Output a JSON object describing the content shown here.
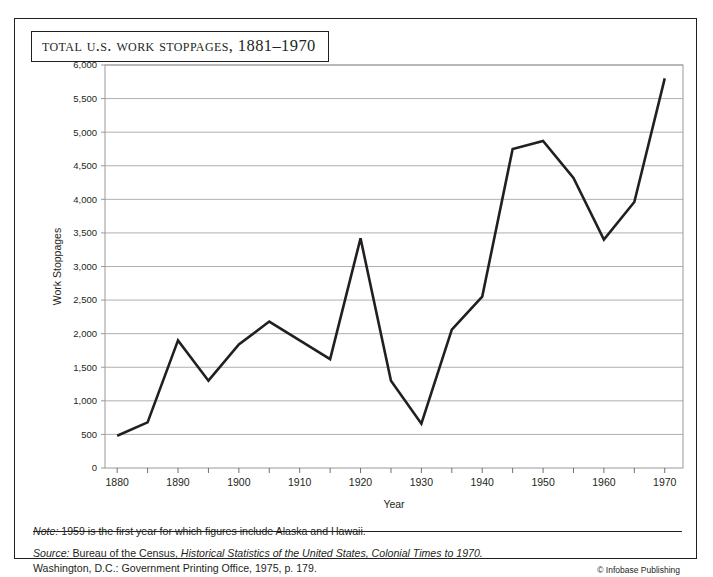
{
  "figure": {
    "title": "Total U.S. Work Stoppages, 1881–1970",
    "note": "Note: 1959 is the first year for which figures include Alaska and Hawaii.",
    "source_prefix": "Source:",
    "source_line1_a": " Bureau of the Census, ",
    "source_line1_italic": "Historical Statistics of the United States, Colonial Times to 1970.",
    "source_line2": "Washington, D.C.: Government Printing Office, 1975, p. 179.",
    "copyright": "© Infobase Publishing",
    "note_prefix": "Note:",
    "note_body": " 1959 is the first year for which figures include Alaska and Hawaii."
  },
  "colors": {
    "line": "#231f20",
    "grid": "#9a9a9a",
    "frame": "#231f20",
    "text": "#231f20",
    "background": "#ffffff"
  },
  "chart_data": {
    "type": "line",
    "title": "Total U.S. Work Stoppages, 1881–1970",
    "xlabel": "Year",
    "ylabel": "Work Stoppages",
    "xlim": [
      1878,
      1973
    ],
    "ylim": [
      0,
      6000
    ],
    "ytick_step": 500,
    "grid": true,
    "legend": "none",
    "x": [
      1880,
      1885,
      1890,
      1895,
      1900,
      1905,
      1910,
      1915,
      1920,
      1925,
      1930,
      1935,
      1940,
      1945,
      1950,
      1955,
      1960,
      1965,
      1970
    ],
    "values": [
      480,
      680,
      1900,
      1300,
      1840,
      2180,
      1900,
      1620,
      3420,
      1300,
      660,
      2060,
      2550,
      4750,
      4870,
      4320,
      3400,
      3960,
      5800
    ],
    "yticks": [
      0,
      500,
      1000,
      1500,
      2000,
      2500,
      3000,
      3500,
      4000,
      4500,
      5000,
      5500,
      6000
    ],
    "ytick_labels": [
      "0",
      "500",
      "1,000",
      "1,500",
      "2,000",
      "2,500",
      "3,000",
      "3,500",
      "4,000",
      "4,500",
      "5,000",
      "5,500",
      "6,000"
    ],
    "xticks_major": [
      1880,
      1890,
      1900,
      1910,
      1920,
      1930,
      1940,
      1950,
      1960,
      1970
    ],
    "xtick_labels": [
      "1880",
      "1890",
      "1900",
      "1910",
      "1920",
      "1930",
      "1940",
      "1950",
      "1960",
      "1970"
    ],
    "xticks_minor": [
      1885,
      1895,
      1905,
      1915,
      1925,
      1935,
      1945,
      1955,
      1965
    ]
  }
}
